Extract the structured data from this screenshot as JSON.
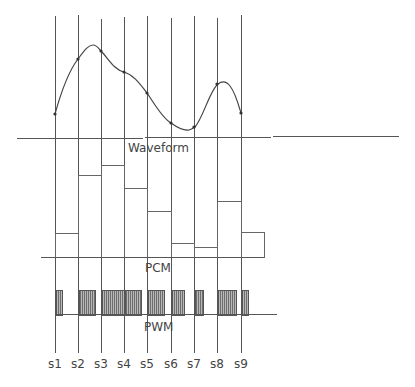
{
  "diagram": {
    "labels": {
      "waveform": "Waveform",
      "pcm": "PCM",
      "pwm": "PWM"
    },
    "samples": [
      "s1",
      "s2",
      "s3",
      "s4",
      "s5",
      "s6",
      "s7",
      "s8",
      "s9"
    ],
    "colors": {
      "line": "#555555",
      "text": "#444444",
      "pwm_fill": "#8a8a8a"
    },
    "waveform": {
      "sample_points_relative": [
        0.22,
        0.79,
        0.89,
        0.66,
        0.44,
        0.12,
        0.08,
        0.53,
        0.23
      ],
      "peaks": [
        "between s2 and s3",
        "near s8"
      ],
      "trough": "between s6 and s7"
    },
    "pcm": {
      "bar_heights_relative": [
        0.22,
        0.79,
        0.89,
        0.66,
        0.44,
        0.12,
        0.08,
        0.53,
        0.23
      ]
    },
    "pwm": {
      "pulse_widths_relative": [
        0.26,
        0.7,
        0.96,
        0.7,
        0.7,
        0.52,
        0.35,
        0.78,
        0.26
      ]
    }
  }
}
